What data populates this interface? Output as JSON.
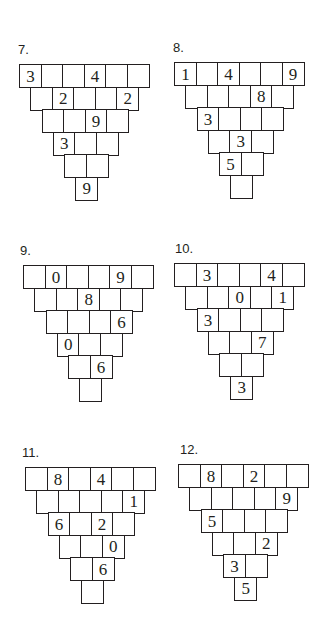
{
  "worksheet": {
    "puzzles": [
      {
        "label": "7.",
        "x": 19,
        "y": 64,
        "labelX": 18,
        "labelY": 42,
        "rows": [
          [
            "3",
            "",
            "",
            "4",
            "",
            ""
          ],
          [
            "",
            "2",
            "",
            "",
            "2"
          ],
          [
            "",
            "",
            "9",
            ""
          ],
          [
            "3",
            "",
            ""
          ],
          [
            "",
            ""
          ],
          [
            "9"
          ]
        ]
      },
      {
        "label": "8.",
        "x": 174,
        "y": 62,
        "labelX": 173,
        "labelY": 40,
        "rows": [
          [
            "1",
            "",
            "4",
            "",
            "",
            "9"
          ],
          [
            "",
            "",
            "",
            "8",
            ""
          ],
          [
            "3",
            "",
            "",
            ""
          ],
          [
            "",
            "3",
            ""
          ],
          [
            "5",
            ""
          ],
          [
            ""
          ]
        ]
      },
      {
        "label": "9.",
        "x": 23,
        "y": 265,
        "labelX": 20,
        "labelY": 243,
        "rows": [
          [
            "",
            "0",
            "",
            "",
            "9",
            ""
          ],
          [
            "",
            "",
            "8",
            "",
            ""
          ],
          [
            "",
            "",
            "",
            "6"
          ],
          [
            "0",
            "",
            ""
          ],
          [
            "",
            "6"
          ],
          [
            ""
          ]
        ]
      },
      {
        "label": "10.",
        "x": 174,
        "y": 263,
        "labelX": 175,
        "labelY": 241,
        "rows": [
          [
            "",
            "3",
            "",
            "",
            "4",
            ""
          ],
          [
            "",
            "",
            "0",
            "",
            "1"
          ],
          [
            "3",
            "",
            "",
            ""
          ],
          [
            "",
            "",
            "7"
          ],
          [
            "",
            ""
          ],
          [
            "3"
          ]
        ]
      },
      {
        "label": "11.",
        "x": 25,
        "y": 467,
        "labelX": 22,
        "labelY": 445,
        "rows": [
          [
            "",
            "8",
            "",
            "4",
            "",
            ""
          ],
          [
            "",
            "",
            "",
            "",
            "1"
          ],
          [
            "6",
            "",
            "2",
            ""
          ],
          [
            "",
            "",
            "0"
          ],
          [
            "",
            "6"
          ],
          [
            ""
          ]
        ]
      },
      {
        "label": "12.",
        "x": 178,
        "y": 464,
        "labelX": 180,
        "labelY": 442,
        "rows": [
          [
            "",
            "8",
            "",
            "2",
            "",
            ""
          ],
          [
            "",
            "",
            "",
            "",
            "9"
          ],
          [
            "5",
            "",
            "",
            ""
          ],
          [
            "",
            "",
            "2"
          ],
          [
            "3",
            ""
          ],
          [
            "5"
          ]
        ]
      }
    ]
  }
}
